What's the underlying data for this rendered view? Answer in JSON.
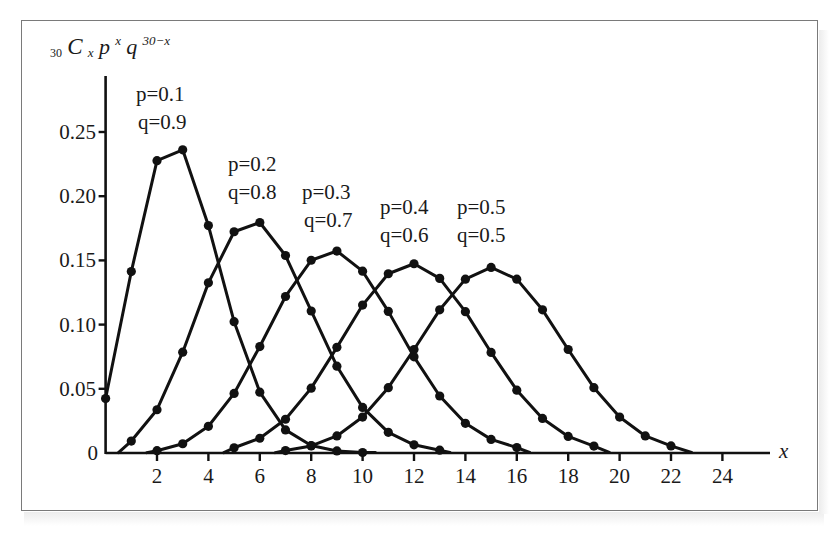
{
  "chart_data": {
    "type": "line",
    "title": "",
    "ylabel": "30CxP^x q^(30-x)",
    "ylabel_parts": {
      "sub": "30",
      "C": "C",
      "Csub": "x",
      "p": "p",
      "pexp": "x",
      "q": "q",
      "qexp": "30−x"
    },
    "xlabel": "x",
    "xlim": [
      0,
      25
    ],
    "ylim": [
      0,
      0.25
    ],
    "grid": false,
    "legend": "inline annotations",
    "x_ticks": [
      2,
      4,
      6,
      8,
      10,
      12,
      14,
      16,
      18,
      20,
      22,
      24
    ],
    "x_tick_labels": [
      "2",
      "4",
      "6",
      "8",
      "10",
      "12",
      "14",
      "16",
      "18",
      "20",
      "22",
      "24"
    ],
    "y_ticks": [
      0,
      0.05,
      0.1,
      0.15,
      0.2,
      0.25
    ],
    "y_tick_labels": [
      "0",
      "0.05",
      "0.10",
      "0.15",
      "0.20",
      "0.25"
    ],
    "series": [
      {
        "name": "p=0.1, q=0.9",
        "label_p": "p=0.1",
        "label_q": "q=0.9",
        "x": [
          0,
          1,
          2,
          3,
          4,
          5,
          6,
          7,
          8,
          9,
          10
        ],
        "values": [
          0.0424,
          0.1413,
          0.2277,
          0.2361,
          0.1771,
          0.1023,
          0.0474,
          0.018,
          0.0058,
          0.0016,
          0.0004
        ],
        "line_end_x": 10.5
      },
      {
        "name": "p=0.2, q=0.8",
        "label_p": "p=0.2",
        "label_q": "q=0.8",
        "x": [
          1,
          2,
          3,
          4,
          5,
          6,
          7,
          8,
          9,
          10,
          11,
          12,
          13
        ],
        "values": [
          0.0093,
          0.0337,
          0.0785,
          0.1325,
          0.1723,
          0.1795,
          0.1538,
          0.1106,
          0.0676,
          0.0355,
          0.0161,
          0.0064,
          0.0022
        ],
        "line_start_x": 0.5,
        "line_end_x": 13.4
      },
      {
        "name": "p=0.3, q=0.7",
        "label_p": "p=0.3",
        "label_q": "q=0.7",
        "x": [
          2,
          3,
          4,
          5,
          6,
          7,
          8,
          9,
          10,
          11,
          12,
          13,
          14,
          15,
          16
        ],
        "values": [
          0.0018,
          0.0072,
          0.0208,
          0.0464,
          0.0829,
          0.1219,
          0.1501,
          0.1573,
          0.1416,
          0.1103,
          0.0749,
          0.0444,
          0.0231,
          0.0106,
          0.0042
        ],
        "line_start_x": 1.6,
        "line_end_x": 16.5
      },
      {
        "name": "p=0.4, q=0.6",
        "label_p": "p=0.4",
        "label_q": "q=0.6",
        "x": [
          5,
          6,
          7,
          8,
          9,
          10,
          11,
          12,
          13,
          14,
          15,
          16,
          17,
          18,
          19
        ],
        "values": [
          0.0041,
          0.0115,
          0.0263,
          0.0505,
          0.0823,
          0.1152,
          0.1396,
          0.1474,
          0.136,
          0.1101,
          0.0783,
          0.0489,
          0.0269,
          0.0129,
          0.0054
        ],
        "line_start_x": 4.6,
        "line_end_x": 19.6
      },
      {
        "name": "p=0.5, q=0.5",
        "label_p": "p=0.5",
        "label_q": "q=0.5",
        "x": [
          7,
          8,
          9,
          10,
          11,
          12,
          13,
          14,
          15,
          16,
          17,
          18,
          19,
          20,
          21,
          22
        ],
        "values": [
          0.0019,
          0.0055,
          0.0133,
          0.028,
          0.0509,
          0.0806,
          0.1115,
          0.1354,
          0.1445,
          0.1354,
          0.1115,
          0.0806,
          0.0509,
          0.028,
          0.0133,
          0.0055
        ],
        "line_start_x": 6.6,
        "line_end_x": 22.8
      }
    ]
  }
}
